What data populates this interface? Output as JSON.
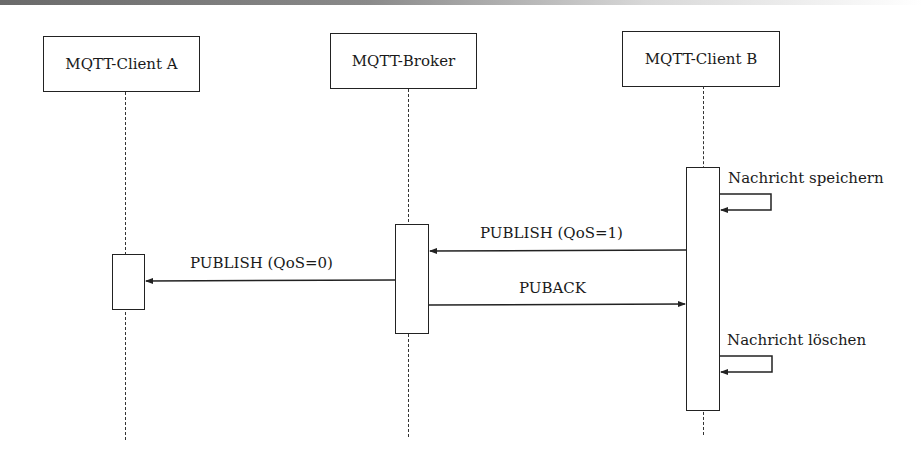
{
  "diagram": {
    "type": "sequence",
    "participants": [
      {
        "id": "client_a",
        "label": "MQTT-Client A"
      },
      {
        "id": "broker",
        "label": "MQTT-Broker"
      },
      {
        "id": "client_b",
        "label": "MQTT-Client B"
      }
    ],
    "messages": [
      {
        "from": "client_b",
        "to": "client_b",
        "label": "Nachricht speichern",
        "kind": "self"
      },
      {
        "from": "client_b",
        "to": "broker",
        "label": "PUBLISH (QoS=1)",
        "kind": "sync"
      },
      {
        "from": "broker",
        "to": "client_a",
        "label": "PUBLISH (QoS=0)",
        "kind": "sync"
      },
      {
        "from": "broker",
        "to": "client_b",
        "label": "PUBACK",
        "kind": "sync"
      },
      {
        "from": "client_b",
        "to": "client_b",
        "label": "Nachricht löschen",
        "kind": "self"
      }
    ],
    "colors": {
      "line": "#222222",
      "background": "#ffffff"
    }
  }
}
